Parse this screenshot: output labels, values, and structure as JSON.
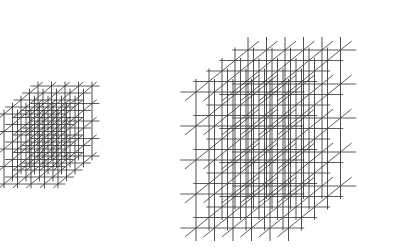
{
  "figure": {
    "background_color": "#ffffff",
    "canvas": {
      "width": 399,
      "height": 248
    }
  },
  "style": {
    "line_color": "#4a4a4a",
    "line_color_dark": "#3c3c3c",
    "line_width": 0.9,
    "line_opacity": 1
  },
  "lattices": [
    {
      "name": "small-lattice",
      "label": "Small cubic lattice",
      "counts": {
        "x": 5,
        "y": 5,
        "z": 5
      },
      "origin": {
        "x": 38,
        "y": 86
      },
      "axis_x": {
        "dx": 13.5,
        "dy": 0.0
      },
      "axis_y": {
        "dx": -8.5,
        "dy": 7.0
      },
      "axis_z": {
        "dx": 0.0,
        "dy": 17.5
      },
      "overhang": 0.55,
      "bounds": {
        "left": 15,
        "top": 77,
        "right": 122,
        "bottom": 172
      }
    },
    {
      "name": "large-lattice",
      "label": "Large cubic lattice",
      "counts": {
        "x": 6,
        "y": 5,
        "z": 5
      },
      "origin": {
        "x": 248,
        "y": 50
      },
      "axis_x": {
        "dx": 18.5,
        "dy": 0.0
      },
      "axis_y": {
        "dx": -13.0,
        "dy": 10.5
      },
      "axis_z": {
        "dx": 0.0,
        "dy": 34.0
      },
      "overhang": 0.85,
      "bounds": {
        "left": 174,
        "top": 10,
        "right": 389,
        "bottom": 240
      }
    }
  ],
  "chart_data": {
    "type": "diagram",
    "elements": [
      {
        "id": "small-lattice",
        "kind": "3d-cubic-lattice",
        "nodes_per_edge": [
          5,
          5,
          5
        ],
        "total_nodes": 125,
        "relative_scale": 1.0
      },
      {
        "id": "large-lattice",
        "kind": "3d-cubic-lattice",
        "nodes_per_edge": [
          6,
          5,
          5
        ],
        "total_nodes": 150,
        "relative_scale": 1.9
      }
    ],
    "legend": [],
    "xlabel": "",
    "ylabel": ""
  }
}
